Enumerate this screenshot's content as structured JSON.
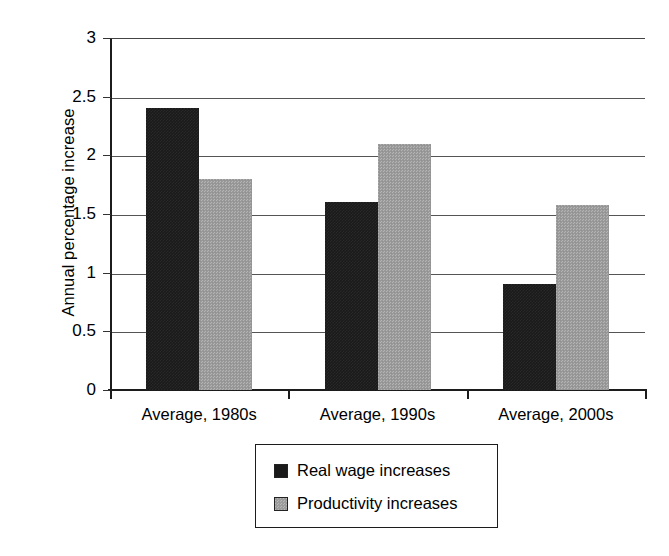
{
  "chart_data": {
    "type": "bar",
    "title": "",
    "subtitle": "",
    "xlabel": "",
    "ylabel": "Annual percentage increase",
    "categories": [
      "Average, 1980s",
      "Average, 1990s",
      "Average, 2000s"
    ],
    "series": [
      {
        "name": "Real wage increases",
        "color": "#1a1a1a",
        "values": [
          2.4,
          1.6,
          0.9
        ]
      },
      {
        "name": "Productivity increases",
        "color": "#9b9b9b",
        "values": [
          1.8,
          2.1,
          1.58
        ]
      }
    ],
    "ylim": [
      0,
      3
    ],
    "ytick_labels": [
      "3",
      "2.5",
      "2",
      "1.5",
      "1",
      "0.5",
      "0"
    ],
    "ytick_values": [
      3,
      2.5,
      2,
      1.5,
      1,
      0.5,
      0
    ],
    "grid": true,
    "legend_position": "bottom-center"
  }
}
